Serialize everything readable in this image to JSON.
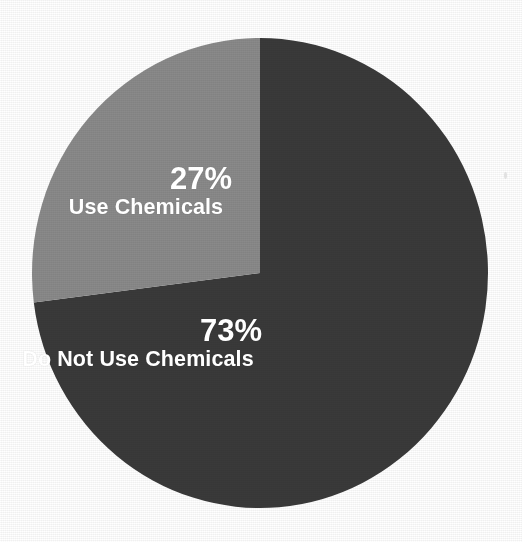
{
  "figure": {
    "background_color": "#ffffff",
    "artifact_name": "scan-speck"
  },
  "chart_data": {
    "type": "pie",
    "title": "",
    "subtitle": "",
    "xlabel": "",
    "ylabel": "",
    "legend_position": "none",
    "grid": false,
    "labels_inside_slices": true,
    "start_angle_deg": 0,
    "direction": "counterclockwise",
    "categories": [
      "Use Chemicals",
      "Do Not Use Chemicals"
    ],
    "values": [
      27,
      73
    ],
    "value_labels": [
      "27%",
      "73%"
    ],
    "unit": "%",
    "colors": [
      "#8a8a8a",
      "#3a3a3a"
    ],
    "slices": [
      {
        "label": "Use Chemicals",
        "value": 27,
        "value_label": "27%",
        "color": "#8a8a8a",
        "start_angle_deg": 0,
        "end_angle_deg": 97.2
      },
      {
        "label": "Do Not Use Chemicals",
        "value": 73,
        "value_label": "73%",
        "color": "#3a3a3a",
        "start_angle_deg": 97.2,
        "end_angle_deg": 360
      }
    ]
  },
  "geometry": {
    "center_x": 260,
    "center_y": 273,
    "radius_x": 228,
    "radius_y": 235
  },
  "colors": {
    "light_slice": "#8a8a8a",
    "dark_slice": "#3a3a3a",
    "label_text": "#ffffff",
    "page_background": "#ffffff"
  }
}
